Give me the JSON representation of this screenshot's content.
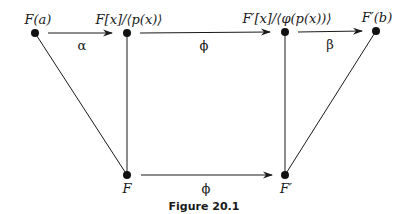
{
  "diagram": {
    "nodes": [
      {
        "id": "Fa",
        "label": "F(a)",
        "x": 35,
        "y": 33
      },
      {
        "id": "Fx_quot",
        "label": "F[x]/⟨p(x)⟩",
        "x": 127,
        "y": 33
      },
      {
        "id": "Fpx_quot",
        "label": "F′[x]/⟨φ(p(x))⟩",
        "x": 285,
        "y": 32
      },
      {
        "id": "Fpb",
        "label": "F′(b)",
        "x": 376,
        "y": 31
      },
      {
        "id": "F",
        "label": "F",
        "x": 127,
        "y": 175
      },
      {
        "id": "Fp",
        "label": "F′",
        "x": 285,
        "y": 175
      }
    ],
    "edges": [
      {
        "from": "Fa",
        "to": "Fx_quot",
        "label": "α",
        "arrow": true
      },
      {
        "from": "Fx_quot",
        "to": "Fpx_quot",
        "label": "ϕ",
        "arrow": true
      },
      {
        "from": "Fpx_quot",
        "to": "Fpb",
        "label": "β",
        "arrow": true
      },
      {
        "from": "F",
        "to": "Fp",
        "label": "ϕ",
        "arrow": true
      },
      {
        "from": "Fa",
        "to": "F",
        "label": "",
        "arrow": false
      },
      {
        "from": "Fx_quot",
        "to": "F",
        "label": "",
        "arrow": false
      },
      {
        "from": "Fpx_quot",
        "to": "Fp",
        "label": "",
        "arrow": false
      },
      {
        "from": "Fpb",
        "to": "Fp",
        "label": "",
        "arrow": false
      }
    ],
    "caption": "Figure 20.1"
  }
}
